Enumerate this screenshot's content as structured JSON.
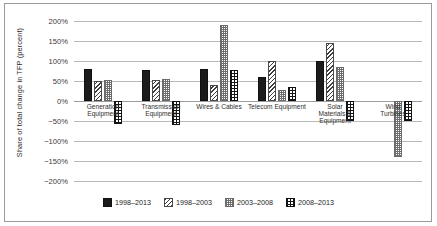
{
  "chart_data": {
    "type": "bar",
    "title": "",
    "xlabel": "",
    "ylabel": "Share of total change in TFP (percent)",
    "ylim": [
      -200,
      200
    ],
    "ytick_labels": [
      "200%",
      "150%",
      "100%",
      "50%",
      "0%",
      "−50%",
      "−100%",
      "−150%",
      "−200%"
    ],
    "ytick_values": [
      200,
      150,
      100,
      50,
      0,
      -50,
      -100,
      -150,
      -200
    ],
    "grid": true,
    "legend_position": "bottom",
    "categories": [
      "Generation\nEquipment",
      "Transmission\nEquipment",
      "Wires & Cables",
      "Telecom Equipment",
      "Solar\nMaterials &\nEquipment",
      "Wind\nTurbines"
    ],
    "series": [
      {
        "name": "1998–2013",
        "pattern": "solid-black",
        "values": [
          80,
          77,
          81,
          60,
          100,
          0
        ]
      },
      {
        "name": "1998–2003",
        "pattern": "diagonal-hatch",
        "values": [
          50,
          53,
          40,
          100,
          145,
          0
        ]
      },
      {
        "name": "2003–2008",
        "pattern": "light-dotted",
        "values": [
          53,
          55,
          190,
          28,
          85,
          -140
        ]
      },
      {
        "name": "2008–2013",
        "pattern": "cross-hatch",
        "values": [
          -58,
          -60,
          78,
          35,
          -50,
          -50
        ]
      }
    ]
  },
  "legend": {
    "items": [
      {
        "label": "1998–2013"
      },
      {
        "label": "1998–2003"
      },
      {
        "label": "2003–2008"
      },
      {
        "label": "2008–2013"
      }
    ]
  }
}
